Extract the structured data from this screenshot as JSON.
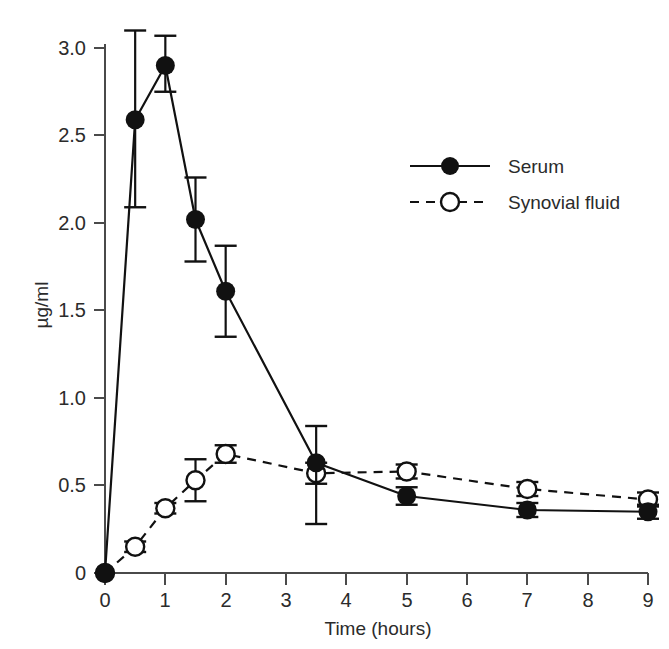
{
  "chart_data": {
    "type": "line",
    "title": "",
    "xlabel": "Time (hours)",
    "ylabel": "µg/ml",
    "xlim": [
      0,
      9
    ],
    "ylim": [
      0,
      3.15
    ],
    "xticks": [
      "0",
      "1",
      "2",
      "3",
      "4",
      "5",
      "6",
      "7",
      "8",
      "9"
    ],
    "xtick_values": [
      0,
      1,
      2,
      3,
      4,
      5,
      6,
      7,
      8,
      9
    ],
    "yticks": [
      "0",
      "0.5",
      "1.0",
      "1.5",
      "2.0",
      "2.5",
      "3.0"
    ],
    "ytick_values": [
      0,
      0.5,
      1.0,
      1.5,
      2.0,
      2.5,
      3.0
    ],
    "grid": false,
    "legend_position": "upper-right-inside",
    "series": [
      {
        "name": "Serum",
        "marker": "filled-circle",
        "linestyle": "solid",
        "color": "#111111",
        "x": [
          0,
          0.5,
          1,
          1.5,
          2,
          3.5,
          5,
          7,
          9
        ],
        "values": [
          0.0,
          2.59,
          2.9,
          2.02,
          1.61,
          0.63,
          0.44,
          0.36,
          0.35
        ],
        "err_low": [
          0.0,
          0.5,
          0.15,
          0.24,
          0.26,
          0.35,
          0.05,
          0.04,
          0.04
        ],
        "err_high": [
          0.0,
          0.51,
          0.17,
          0.24,
          0.26,
          0.21,
          0.05,
          0.04,
          0.04
        ]
      },
      {
        "name": "Synovial fluid",
        "marker": "open-circle",
        "linestyle": "dashed",
        "color": "#111111",
        "x": [
          0,
          0.5,
          1,
          1.5,
          2,
          3.5,
          5,
          7,
          9
        ],
        "values": [
          0.0,
          0.15,
          0.37,
          0.53,
          0.68,
          0.57,
          0.58,
          0.48,
          0.42
        ],
        "err_low": [
          0.0,
          0.03,
          0.03,
          0.12,
          0.05,
          0.06,
          0.04,
          0.04,
          0.04
        ],
        "err_high": [
          0.0,
          0.03,
          0.03,
          0.12,
          0.05,
          0.06,
          0.04,
          0.04,
          0.04
        ]
      }
    ]
  },
  "axes": {
    "x_title": "Time (hours)",
    "y_title": "µg/ml"
  },
  "legend": {
    "items": [
      {
        "label": "Serum",
        "marker": "filled-circle",
        "linestyle": "solid"
      },
      {
        "label": "Synovial fluid",
        "marker": "open-circle",
        "linestyle": "dashed"
      }
    ]
  },
  "ytick_labels": {
    "t0": "0",
    "t1": "0.5",
    "t2": "1.0",
    "t3": "1.5",
    "t4": "2.0",
    "t5": "2.5",
    "t6": "3.0"
  },
  "xtick_labels": {
    "t0": "0",
    "t1": "1",
    "t2": "2",
    "t3": "3",
    "t4": "4",
    "t5": "5",
    "t6": "6",
    "t7": "7",
    "t8": "8",
    "t9": "9"
  }
}
